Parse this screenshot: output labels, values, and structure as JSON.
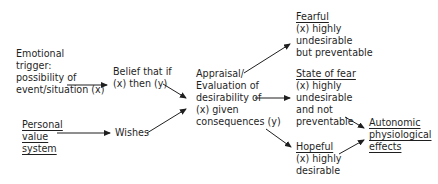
{
  "diagram": {
    "nodes": {
      "emotional_trigger": {
        "lines": [
          "Emotional",
          "trigger:",
          "possibility of",
          "event/situation (x)"
        ]
      },
      "personal_value": {
        "lines": [
          "Personal",
          "value",
          "system"
        ],
        "underlined": true
      },
      "belief": {
        "lines": [
          "Belief that if",
          "(x) then (y)"
        ]
      },
      "wishes": {
        "lines": [
          "Wishes"
        ]
      },
      "appraisal": {
        "lines": [
          "Appraisal/",
          "Evaluation of",
          "desirability of",
          "(x) given",
          "consequences (y)"
        ]
      },
      "fearful": {
        "title": "Fearful",
        "lines": [
          "(x) highly",
          "undesirable",
          "but preventable"
        ]
      },
      "state_of_fear": {
        "title": "State of fear",
        "lines": [
          "(x) highly",
          "undesirable",
          "and not",
          "preventable"
        ]
      },
      "hopeful": {
        "title": "Hopeful",
        "lines": [
          "(x) highly",
          "desirable"
        ]
      },
      "autonomic": {
        "lines": [
          "Autonomic",
          "physiological",
          "effects"
        ],
        "underlined": true
      }
    },
    "edges": [
      {
        "from": "emotional_trigger",
        "to": "belief"
      },
      {
        "from": "personal_value",
        "to": "wishes"
      },
      {
        "from": "belief",
        "to": "appraisal"
      },
      {
        "from": "wishes",
        "to": "appraisal"
      },
      {
        "from": "appraisal",
        "to": "fearful"
      },
      {
        "from": "appraisal",
        "to": "state_of_fear"
      },
      {
        "from": "appraisal",
        "to": "hopeful"
      },
      {
        "from": "state_of_fear",
        "to": "autonomic"
      },
      {
        "from": "hopeful",
        "to": "autonomic"
      }
    ],
    "colors": {
      "ink": "#1f1f1f",
      "background": "#ffffff"
    }
  }
}
